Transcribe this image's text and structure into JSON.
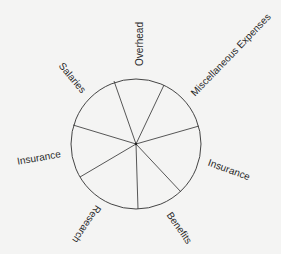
{
  "diagram": {
    "type": "segmented-circle",
    "background_color": "#f4f4f3",
    "stroke_color": "#444444",
    "circle": {
      "cx": 136,
      "cy": 144,
      "r": 65
    },
    "spoke_endpoints": [
      {
        "x": 114,
        "y": 81
      },
      {
        "x": 164,
        "y": 85
      },
      {
        "x": 199,
        "y": 126
      },
      {
        "x": 181,
        "y": 192
      },
      {
        "x": 138,
        "y": 209
      },
      {
        "x": 80,
        "y": 177
      },
      {
        "x": 73,
        "y": 125
      }
    ],
    "labels": [
      {
        "text": "Overhead",
        "x": 140,
        "y": 44,
        "rotate": -90
      },
      {
        "text": "Miscellaneous Expenses",
        "x": 231,
        "y": 55,
        "rotate": -46
      },
      {
        "text": "Insurance",
        "x": 229,
        "y": 170,
        "rotate": 20
      },
      {
        "text": "Benefits",
        "x": 179,
        "y": 228,
        "rotate": 55
      },
      {
        "text": "Research",
        "x": 86,
        "y": 224,
        "rotate": 124
      },
      {
        "text": "Insurance",
        "x": 39,
        "y": 158,
        "rotate": -10
      },
      {
        "text": "Salaries",
        "x": 72,
        "y": 78,
        "rotate": 50
      }
    ]
  }
}
